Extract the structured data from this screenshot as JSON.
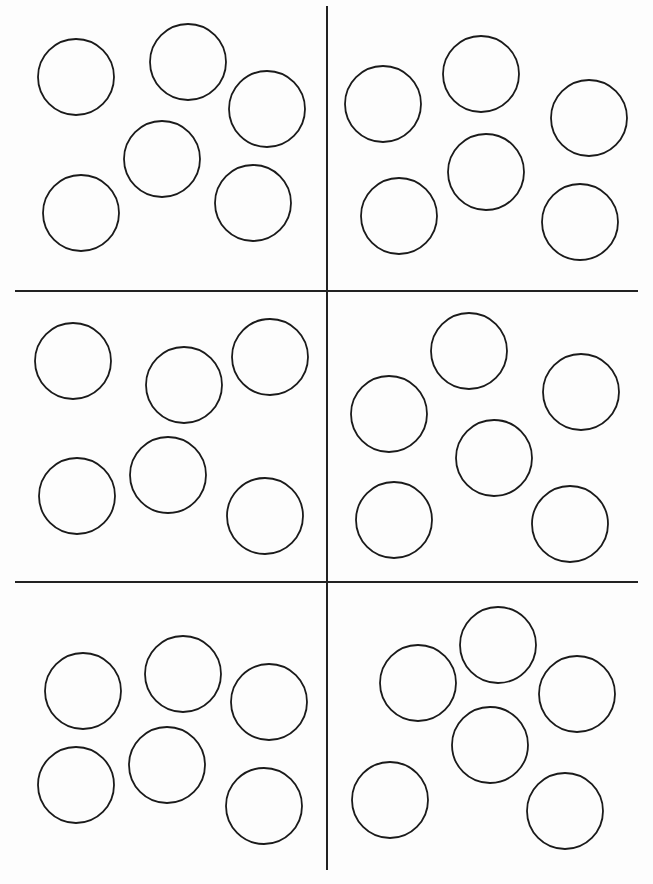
{
  "worksheet": {
    "line_color": "#222222",
    "circle_stroke": "#1a1a1a",
    "grid": {
      "vertical": {
        "x": 327,
        "y1": 6,
        "y2": 870
      },
      "horizontal": [
        {
          "y": 291,
          "x1": 15,
          "x2": 638
        },
        {
          "y": 582,
          "x1": 15,
          "x2": 638
        }
      ]
    },
    "panels": [
      {
        "id": 1,
        "circles": [
          [
            76,
            77
          ],
          [
            188,
            62
          ],
          [
            267,
            109
          ],
          [
            162,
            159
          ],
          [
            81,
            213
          ],
          [
            253,
            203
          ]
        ]
      },
      {
        "id": 2,
        "circles": [
          [
            383,
            104
          ],
          [
            481,
            74
          ],
          [
            589,
            118
          ],
          [
            486,
            172
          ],
          [
            399,
            216
          ],
          [
            580,
            222
          ]
        ]
      },
      {
        "id": 3,
        "circles": [
          [
            73,
            361
          ],
          [
            184,
            385
          ],
          [
            270,
            357
          ],
          [
            168,
            475
          ],
          [
            77,
            496
          ],
          [
            265,
            516
          ]
        ]
      },
      {
        "id": 4,
        "circles": [
          [
            469,
            351
          ],
          [
            389,
            414
          ],
          [
            581,
            392
          ],
          [
            494,
            458
          ],
          [
            394,
            520
          ],
          [
            570,
            524
          ]
        ]
      },
      {
        "id": 5,
        "circles": [
          [
            83,
            691
          ],
          [
            183,
            674
          ],
          [
            269,
            702
          ],
          [
            167,
            765
          ],
          [
            76,
            785
          ],
          [
            264,
            806
          ]
        ]
      },
      {
        "id": 6,
        "circles": [
          [
            418,
            683
          ],
          [
            498,
            645
          ],
          [
            577,
            694
          ],
          [
            490,
            745
          ],
          [
            390,
            800
          ],
          [
            565,
            811
          ]
        ]
      }
    ],
    "circle_radius": 38
  }
}
